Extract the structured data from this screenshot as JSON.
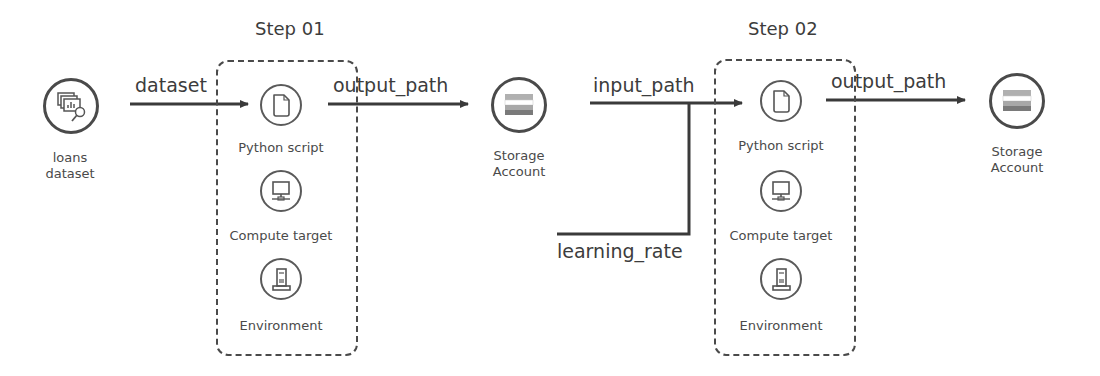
{
  "diagram": {
    "nodes": {
      "loans_dataset": {
        "label_line1": "loans",
        "label_line2": "dataset",
        "icon": "dataset-search-icon"
      },
      "storage_1": {
        "label_line1": "Storage",
        "label_line2": "Account",
        "icon": "storage-account-icon"
      },
      "storage_2": {
        "label_line1": "Storage",
        "label_line2": "Account",
        "icon": "storage-account-icon"
      }
    },
    "steps": [
      {
        "title": "Step 01",
        "items": [
          {
            "label": "Python script",
            "icon": "document-icon"
          },
          {
            "label": "Compute target",
            "icon": "monitor-icon"
          },
          {
            "label": "Environment",
            "icon": "server-icon"
          }
        ]
      },
      {
        "title": "Step 02",
        "items": [
          {
            "label": "Python script",
            "icon": "document-icon"
          },
          {
            "label": "Compute target",
            "icon": "monitor-icon"
          },
          {
            "label": "Environment",
            "icon": "server-icon"
          }
        ]
      }
    ],
    "edges": {
      "dataset": "dataset",
      "output_path_1": "output_path",
      "input_path": "input_path",
      "learning_rate": "learning_rate",
      "output_path_2": "output_path"
    },
    "colors": {
      "stroke": "#3a3a3a",
      "storage_band": "#b0b0b0",
      "storage_dark": "#7a7a7a"
    }
  }
}
